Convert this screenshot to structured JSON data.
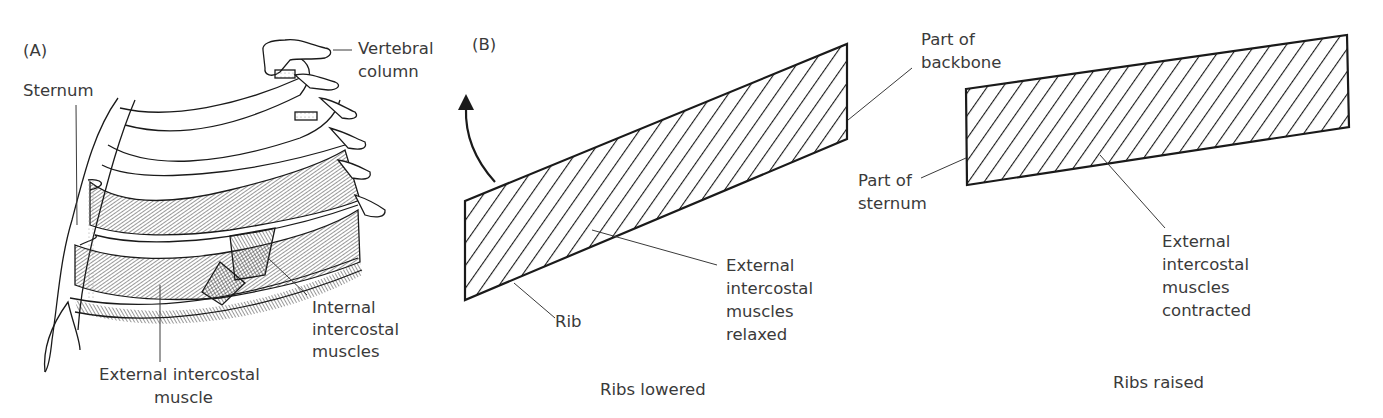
{
  "panel_a": {
    "label": "(A)",
    "annotations": {
      "vertebral_column": [
        "Vertebral",
        "column"
      ],
      "sternum": "Sternum",
      "internal_intercostal": [
        "Internal",
        "intercostal",
        "muscles"
      ],
      "external_intercostal": [
        "External intercostal",
        "muscle"
      ]
    }
  },
  "panel_b": {
    "label": "(B)",
    "left_diagram": {
      "caption": "Ribs lowered",
      "rib_label": "Rib",
      "muscle_label": [
        "External",
        "intercostal",
        "muscles",
        "relaxed"
      ],
      "backbone_label": [
        "Part of",
        "backbone"
      ]
    },
    "right_diagram": {
      "caption": "Ribs raised",
      "sternum_label": [
        "Part of",
        "sternum"
      ],
      "muscle_label": [
        "External",
        "intercostal",
        "muscles",
        "contracted"
      ]
    }
  },
  "colors": {
    "ink": "#1a1a1a",
    "text": "#3a3a3a",
    "background": "#ffffff"
  }
}
